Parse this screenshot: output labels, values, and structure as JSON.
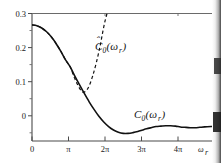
{
  "chart_data": {
    "type": "line",
    "title": "",
    "xlabel": "ωr",
    "ylabel": "",
    "xlim": [
      0,
      14.8
    ],
    "ylim": [
      -0.035,
      0.3
    ],
    "grid": false,
    "legend_position": "inline-annotations",
    "x_tick_labels": [
      "0",
      "π",
      "2π",
      "3π",
      "4π"
    ],
    "x_tick_values": [
      0,
      3.1416,
      6.2832,
      9.4248,
      12.5664
    ],
    "y_tick_labels": [
      "0.3",
      "0.2",
      "0.1",
      "0"
    ],
    "y_tick_values": [
      0.3,
      0.2,
      0.1,
      0
    ],
    "y_minor_tick_values": [
      0.25,
      0.15,
      0.05,
      -0.02
    ],
    "series": [
      {
        "name": "C0(wr)",
        "style": "solid",
        "color": "#111111",
        "x": [
          0.0,
          0.4,
          0.8,
          1.2,
          1.6,
          2.0,
          2.4,
          2.8,
          3.14,
          3.5,
          3.9,
          4.3,
          4.7,
          5.1,
          5.5,
          5.9,
          6.3,
          6.7,
          7.1,
          7.5,
          7.9,
          8.3,
          8.7,
          9.1,
          9.42,
          9.8,
          10.2,
          10.6,
          11.0,
          11.4,
          11.8,
          12.2,
          12.57,
          13.0,
          13.4,
          13.8,
          14.2,
          14.8
        ],
        "y": [
          0.27,
          0.268,
          0.262,
          0.252,
          0.238,
          0.22,
          0.199,
          0.176,
          0.16,
          0.137,
          0.113,
          0.09,
          0.068,
          0.048,
          0.03,
          0.015,
          0.003,
          -0.006,
          -0.012,
          -0.015,
          -0.015,
          -0.013,
          -0.01,
          -0.006,
          -0.003,
          0.0,
          0.003,
          0.004,
          0.005,
          0.005,
          0.004,
          0.002,
          0.001,
          0.0,
          0.0,
          0.001,
          0.002,
          0.003
        ]
      },
      {
        "name": "C0hat(wr)",
        "style": "dashed",
        "color": "#111111",
        "x": [
          0.0,
          0.4,
          0.8,
          1.2,
          1.6,
          2.0,
          2.4,
          2.8,
          3.14,
          3.4,
          3.7,
          4.0,
          4.2,
          4.45,
          4.7,
          5.0,
          5.3,
          5.6,
          5.9,
          6.1,
          6.3
        ],
        "y": [
          0.27,
          0.268,
          0.262,
          0.252,
          0.238,
          0.22,
          0.199,
          0.176,
          0.16,
          0.138,
          0.116,
          0.099,
          0.093,
          0.097,
          0.11,
          0.137,
          0.172,
          0.215,
          0.265,
          0.292,
          0.315
        ]
      }
    ],
    "annotations": [
      {
        "name": "hat-curve-label",
        "text_main": "C",
        "text_sub": "0",
        "text_arg": "(ω",
        "text_argsub": "r",
        "text_close": ")",
        "hat": true,
        "x_px": 95,
        "y_px": 40
      },
      {
        "name": "plain-curve-label",
        "text_main": "C",
        "text_sub": "0",
        "text_arg": "(ω",
        "text_argsub": "r",
        "text_close": ")",
        "hat": false,
        "x_px": 133,
        "y_px": 113
      }
    ]
  },
  "labels": {
    "y_03": "0.3",
    "y_02": "0.2",
    "y_01": "0.1",
    "y_00": "0",
    "x_0": "0",
    "x_pi": "π",
    "x_2pi": "2π",
    "x_3pi": "3π",
    "x_4pi": "4π",
    "x_axis_name": "ω",
    "x_axis_name_sub": "r",
    "hat_label_c": "C",
    "hat_label_sub": "0",
    "hat_label_open": "(ω",
    "hat_label_argsub": "r",
    "hat_label_close": ")",
    "hat_glyph": "ˆ",
    "plain_label_c": "C",
    "plain_label_sub": "0",
    "plain_label_open": "(ω",
    "plain_label_argsub": "r",
    "plain_label_close": ")"
  },
  "colors": {
    "curve": "#111111",
    "axis": "#4a4a4a",
    "background": "#ffffff"
  }
}
